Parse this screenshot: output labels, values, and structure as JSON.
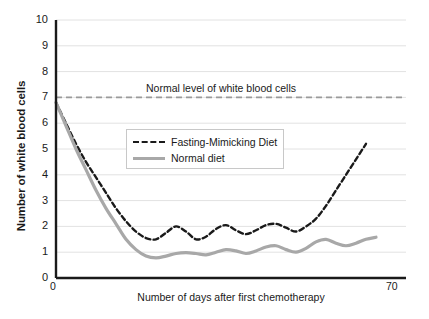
{
  "chart_data": {
    "type": "line",
    "title": "",
    "xlabel": "Number of days after first chemotherapy",
    "ylabel": "Number of white blood cells",
    "xlim": [
      0,
      70
    ],
    "ylim": [
      0,
      10
    ],
    "grid": true,
    "legend_position": "upper-center-inside",
    "y_ticks": [
      "0",
      "1",
      "2",
      "3",
      "4",
      "5",
      "6",
      "7",
      "8",
      "9",
      "10"
    ],
    "x_ticks": [
      "0",
      "70"
    ],
    "annotations": [
      {
        "name": "normal-level-line",
        "text": "Normal level of white blood cells",
        "y_value": 7,
        "style": "dashed",
        "color": "#9a9a9a"
      }
    ],
    "series": [
      {
        "name": "Fasting-Mimicking Diet",
        "color": "#1a1a1a",
        "style": "dashed",
        "points": [
          [
            0,
            6.8
          ],
          [
            2,
            6.0
          ],
          [
            4,
            5.2
          ],
          [
            6,
            4.5
          ],
          [
            8,
            3.9
          ],
          [
            10,
            3.3
          ],
          [
            12,
            2.7
          ],
          [
            14,
            2.2
          ],
          [
            16,
            1.8
          ],
          [
            18,
            1.55
          ],
          [
            20,
            1.5
          ],
          [
            22,
            1.75
          ],
          [
            24,
            2.0
          ],
          [
            26,
            1.8
          ],
          [
            28,
            1.5
          ],
          [
            30,
            1.6
          ],
          [
            32,
            1.9
          ],
          [
            34,
            2.05
          ],
          [
            36,
            1.85
          ],
          [
            38,
            1.7
          ],
          [
            40,
            1.85
          ],
          [
            42,
            2.05
          ],
          [
            44,
            2.1
          ],
          [
            46,
            1.95
          ],
          [
            48,
            1.8
          ],
          [
            50,
            2.0
          ],
          [
            52,
            2.3
          ],
          [
            54,
            2.8
          ],
          [
            56,
            3.4
          ],
          [
            58,
            4.0
          ],
          [
            60,
            4.6
          ],
          [
            62,
            5.2
          ]
        ]
      },
      {
        "name": "Normal diet",
        "color": "#a8a8a8",
        "style": "solid",
        "points": [
          [
            0,
            6.8
          ],
          [
            2,
            5.9
          ],
          [
            4,
            5.0
          ],
          [
            6,
            4.2
          ],
          [
            8,
            3.4
          ],
          [
            10,
            2.7
          ],
          [
            12,
            2.1
          ],
          [
            14,
            1.5
          ],
          [
            16,
            1.1
          ],
          [
            18,
            0.85
          ],
          [
            20,
            0.78
          ],
          [
            22,
            0.85
          ],
          [
            24,
            0.95
          ],
          [
            26,
            0.98
          ],
          [
            28,
            0.95
          ],
          [
            30,
            0.9
          ],
          [
            32,
            1.0
          ],
          [
            34,
            1.1
          ],
          [
            36,
            1.05
          ],
          [
            38,
            0.95
          ],
          [
            40,
            1.05
          ],
          [
            42,
            1.2
          ],
          [
            44,
            1.25
          ],
          [
            46,
            1.1
          ],
          [
            48,
            1.0
          ],
          [
            50,
            1.15
          ],
          [
            52,
            1.4
          ],
          [
            54,
            1.5
          ],
          [
            56,
            1.35
          ],
          [
            58,
            1.25
          ],
          [
            60,
            1.35
          ],
          [
            62,
            1.5
          ],
          [
            64,
            1.58
          ]
        ]
      }
    ]
  },
  "legend": {
    "items": [
      {
        "label": "Fasting-Mimicking Diet"
      },
      {
        "label": "Normal diet"
      }
    ]
  },
  "axes": {
    "y_title": "Number of white blood cells",
    "x_title": "Number of days after first chemotherapy",
    "y_ticks": [
      "10",
      "9",
      "8",
      "7",
      "6",
      "5",
      "4",
      "3",
      "2",
      "1",
      "0"
    ],
    "x_tick_left": "0",
    "x_tick_right": "70"
  },
  "annotation": {
    "normal_level_label": "Normal level of white blood cells"
  }
}
